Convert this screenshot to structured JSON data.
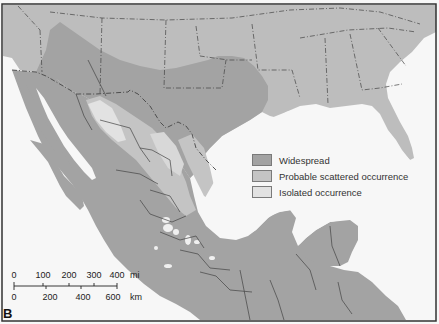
{
  "map": {
    "panel_label": "B",
    "colors": {
      "water": "#f7f7f7",
      "land_outside": "#bdbdbd",
      "widespread": "#a3a3a3",
      "probable": "#c4c4c4",
      "isolated": "#e2e2e2",
      "border": "#444444",
      "frame": "#333333"
    },
    "legend": {
      "items": [
        {
          "label": "Widespread",
          "color": "#a3a3a3"
        },
        {
          "label": "Probable scattered occurrence",
          "color": "#c4c4c4"
        },
        {
          "label": "Isolated occurrence",
          "color": "#e2e2e2"
        }
      ]
    },
    "scale": {
      "mi_ticks": [
        "0",
        "100",
        "200",
        "300",
        "400"
      ],
      "mi_unit": "mi",
      "km_ticks": [
        "0",
        "200",
        "400",
        "600"
      ],
      "km_unit": "km"
    }
  }
}
